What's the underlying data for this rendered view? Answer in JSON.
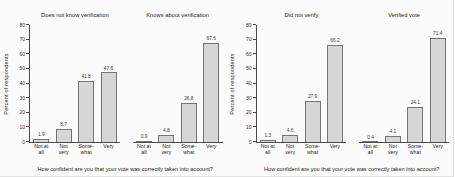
{
  "chart_data": {
    "type": "bar",
    "ylabel": "Percent of respondents",
    "xlabel": "How confident are you that your vote was correctly taken into account?",
    "ylim": [
      0,
      80
    ],
    "yticks": [
      0,
      10,
      20,
      30,
      40,
      50,
      60,
      70,
      80
    ],
    "categories": [
      "Not at all",
      "Not very",
      "Somewhat",
      "Very"
    ],
    "category_label_lines": [
      [
        "Not at",
        "all"
      ],
      [
        "Not",
        "very"
      ],
      [
        "Some-",
        "what"
      ],
      [
        "Very"
      ]
    ],
    "legend": "none",
    "grid": "off",
    "figures": [
      {
        "panels": [
          {
            "title": "Does not know verification",
            "values": [
              1.9,
              8.7,
              41.8,
              47.6
            ]
          },
          {
            "title": "Knows about verification",
            "values": [
              0.9,
              4.8,
              26.8,
              67.6
            ]
          }
        ]
      },
      {
        "panels": [
          {
            "title": "Did not verify",
            "values": [
              1.3,
              4.6,
              27.9,
              66.2
            ]
          },
          {
            "title": "Verified vote",
            "values": [
              0.4,
              4.1,
              24.1,
              71.4
            ]
          }
        ]
      }
    ]
  },
  "colors": {
    "bar_fill": "#d6d6d6",
    "bar_border": "#757575",
    "axis": "#4a4a4a",
    "background": "#fbfbfb",
    "text": "#222222"
  }
}
